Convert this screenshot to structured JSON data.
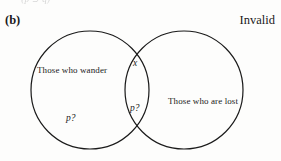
{
  "figure": {
    "part_label": "(b)",
    "verdict": "Invalid",
    "clipped_formula": "~(p ⊃ q)"
  },
  "venn": {
    "left_circle": {
      "label": "Those who wander",
      "cx": 90,
      "cy": 90,
      "r": 59
    },
    "right_circle": {
      "label": "Those who are lost",
      "cx": 184,
      "cy": 90,
      "r": 59
    },
    "marks": [
      {
        "name": "x-in-intersection",
        "text": "x",
        "region": "intersection-upper"
      },
      {
        "name": "p-question-intersection",
        "text": "p?",
        "region": "intersection-lower"
      },
      {
        "name": "p-question-left",
        "text": "p?",
        "region": "left-only-lower"
      }
    ],
    "stroke_color": "#1a1a1a",
    "stroke_width": 1.2,
    "fill_color": "none"
  }
}
